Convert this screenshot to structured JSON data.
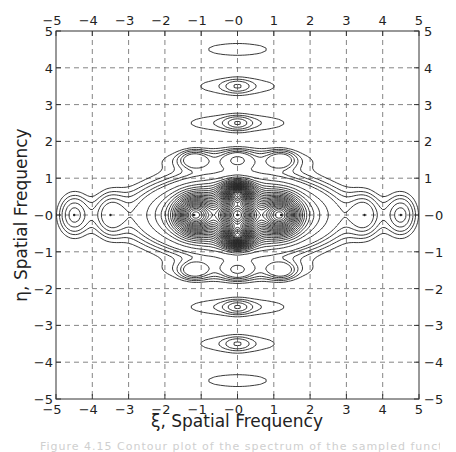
{
  "chart_data": {
    "type": "contour",
    "title": "",
    "xlabel": "ξ, Spatial Frequency",
    "ylabel": "η, Spatial Frequency",
    "xlim": [
      -5,
      5
    ],
    "ylim": [
      -5,
      5
    ],
    "x_ticks": [
      -5,
      -4,
      -3,
      -2,
      -1,
      0,
      1,
      2,
      3,
      4,
      5
    ],
    "y_ticks": [
      -5,
      -4,
      -3,
      -2,
      -1,
      0,
      1,
      2,
      3,
      4,
      5
    ],
    "x_tick_labels": [
      "−5",
      "−4",
      "−3",
      "−2",
      "−1",
      "−0",
      "1",
      "2",
      "3",
      "4",
      "5"
    ],
    "y_tick_labels": [
      "−5",
      "−4",
      "−3",
      "−2",
      "−1",
      "−0",
      "1",
      "2",
      "3",
      "4",
      "5"
    ],
    "grid": "dashed",
    "ticks_on_all_four_sides": true,
    "features": {
      "central_peaks": [
        {
          "xi": -1.2,
          "eta": 0
        },
        {
          "xi": 0,
          "eta": 0
        },
        {
          "xi": 1.2,
          "eta": 0
        }
      ],
      "dense_regions": [
        {
          "xi": 0,
          "eta": 0.6
        },
        {
          "xi": 0,
          "eta": -0.6
        }
      ],
      "side_lobes": [
        {
          "xi": -4.5,
          "eta": 0
        },
        {
          "xi": -3.5,
          "eta": 0
        },
        {
          "xi": 3.5,
          "eta": 0
        },
        {
          "xi": 4.5,
          "eta": 0
        }
      ],
      "horizontal_bands_eta": [
        -4.5,
        -3.5,
        -2.5,
        -1.5,
        1.5,
        2.5,
        3.5,
        4.5
      ],
      "band_local_peaks_at_eta_1_5": [
        -1.2,
        0,
        1.2
      ],
      "band_local_peaks_at_eta_2_5": [
        0
      ],
      "band_local_peaks_at_eta_3_5": [
        0
      ]
    }
  },
  "caption": "Figure 4.15  Contour plot of the spectrum of the sampled function"
}
